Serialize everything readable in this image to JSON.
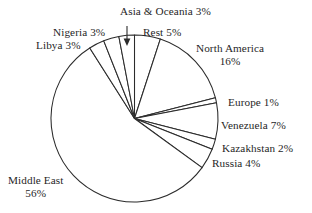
{
  "chart_data": {
    "type": "pie",
    "title": "",
    "subtitle": "",
    "xlabel": "",
    "ylabel": "",
    "units": "percent",
    "legend_position": "none",
    "grid": false,
    "labels_outside": true,
    "total": 100,
    "start_angle_deg": -90,
    "direction": "clockwise",
    "categories": [
      "Rest",
      "North America",
      "Europe",
      "Venezuela",
      "Kazakhstan",
      "Russia",
      "Middle East",
      "Libya",
      "Nigeria",
      "Asia & Oceania"
    ],
    "values": [
      5,
      16,
      1,
      7,
      2,
      4,
      56,
      3,
      3,
      3
    ],
    "slices": [
      {
        "name": "Rest",
        "value": 5,
        "label": "Rest 5%",
        "name_line": "Rest 5%",
        "pct_line": ""
      },
      {
        "name": "North America",
        "value": 16,
        "label": "North America 16%",
        "name_line": "North America",
        "pct_line": "16%"
      },
      {
        "name": "Europe",
        "value": 1,
        "label": "Europe 1%",
        "name_line": "Europe 1%",
        "pct_line": ""
      },
      {
        "name": "Venezuela",
        "value": 7,
        "label": "Venezuela 7%",
        "name_line": "Venezuela 7%",
        "pct_line": ""
      },
      {
        "name": "Kazakhstan",
        "value": 2,
        "label": "Kazakhstan 2%",
        "name_line": "Kazakhstan 2%",
        "pct_line": ""
      },
      {
        "name": "Russia",
        "value": 4,
        "label": "Russia 4%",
        "name_line": "Russia 4%",
        "pct_line": ""
      },
      {
        "name": "Middle East",
        "value": 56,
        "label": "Middle East 56%",
        "name_line": "Middle East",
        "pct_line": "56%"
      },
      {
        "name": "Libya",
        "value": 3,
        "label": "Libya 3%",
        "name_line": "Libya 3%",
        "pct_line": ""
      },
      {
        "name": "Nigeria",
        "value": 3,
        "label": "Nigeria 3%",
        "name_line": "Nigeria 3%",
        "pct_line": ""
      },
      {
        "name": "Asia & Oceania",
        "value": 3,
        "label": "Asia & Oceania 3%",
        "name_line": "Asia & Oceania 3%",
        "pct_line": ""
      }
    ],
    "annotations": [
      {
        "name": "asia-oceania-leader-arrow",
        "kind": "arrow",
        "points_to": "Asia & Oceania",
        "direction": "down"
      }
    ]
  },
  "style": {
    "background": "#ffffff",
    "slice_fill": "#ffffff",
    "outline_color": "#2b2b2b",
    "text_color": "#1f1f1f"
  }
}
